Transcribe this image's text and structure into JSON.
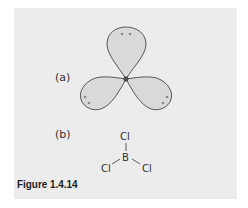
{
  "figure": {
    "caption": "Figure 1.4.14",
    "panel_a_label": "(a)",
    "panel_b_label": "(b)",
    "orbital": {
      "description": "Three sp2 hybrid orbital lobes of boron at 120 degrees, each with an electron pair",
      "lobe_fill": "#d9d9d9",
      "lobe_stroke": "#333333",
      "electron_color": "#888888",
      "lobes": 3
    },
    "molecule": {
      "central_atom": "B",
      "ligands": [
        "Cl",
        "Cl",
        "Cl"
      ]
    }
  }
}
